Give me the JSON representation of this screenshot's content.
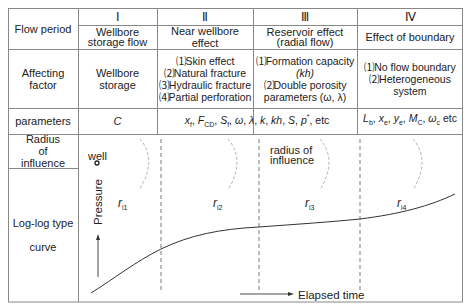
{
  "table": {
    "row_headers": {
      "flow_period": "Flow period",
      "affecting_factor": "Affecting factor",
      "parameters": "parameters",
      "radius_of_influence": "Radius of influence",
      "log_log_type_curve_line1": "Log-log type",
      "log_log_type_curve_line2": "curve"
    },
    "periods": [
      {
        "numeral": "Ⅰ",
        "name": "Wellbore storage flow",
        "affecting_factor": [
          "Wellbore storage"
        ],
        "parameters": "C"
      },
      {
        "numeral": "Ⅱ",
        "name": "Near wellbore effect",
        "affecting_factor": [
          "⑴Skin effect",
          "⑵Natural fracture",
          "⑶Hydraulic fracture",
          "⑷Partial perforation"
        ],
        "parameters": "xf, FCD, Sf, ω, λ, k, kh, S, p*, etc"
      },
      {
        "numeral": "Ⅲ",
        "name": "Reservoir effect (radial flow)",
        "affecting_factor": [
          "⑴Formation capacity",
          "(kh)",
          "⑵Double porosity",
          "parameters (ω, λ)"
        ],
        "parameters": ""
      },
      {
        "numeral": "Ⅳ",
        "name": "Effect of boundary",
        "affecting_factor": [
          "⑴No flow boundary",
          "⑵Heterogeneous",
          "system"
        ],
        "parameters": "Lb, xe, ye, MC, ωc etc"
      }
    ]
  },
  "diagram": {
    "well_label": "well",
    "radius_label_line1": "radius of",
    "radius_label_line2": "influence",
    "y_axis_label": "Pressure",
    "x_axis_label": "Elapsed time",
    "regions": [
      "r",
      "r",
      "r",
      "r"
    ],
    "region_subscripts": [
      "i1",
      "i2",
      "i3",
      "i4"
    ],
    "colors": {
      "line": "#333333",
      "grid": "#999999",
      "arc": "#aaaaaa"
    }
  },
  "text": {
    "wellbore_line1": "Wellbore",
    "wellbore_line2": "storage flow",
    "reservoir_line1": "Reservoir effect",
    "reservoir_line2": "(radial flow)",
    "param_c": "C",
    "param_ii": "x",
    "param_iv": "L"
  }
}
